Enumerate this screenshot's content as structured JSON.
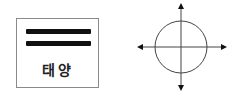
{
  "symbol_box": {
    "label": "태양",
    "bars": 2,
    "border_color": "#8a8a8a",
    "bar_color": "#111111"
  },
  "compass": {
    "icon": "circle-with-four-directional-arrows",
    "line_color": "#333333"
  }
}
